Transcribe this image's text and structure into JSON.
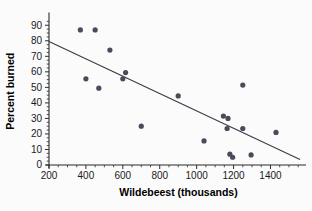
{
  "chart_data": {
    "type": "scatter",
    "title": "",
    "xlabel": "Wildebeest (thousands)",
    "ylabel": "Percent burned",
    "xlim": [
      200,
      1560
    ],
    "ylim": [
      0,
      95
    ],
    "xticks": [
      200,
      400,
      600,
      800,
      1000,
      1200,
      1400
    ],
    "xtick_labels": [
      "200",
      "400",
      "600",
      "800",
      "1000",
      "1200",
      "1400"
    ],
    "yticks": [
      0,
      10,
      20,
      30,
      40,
      50,
      60,
      70,
      80,
      90
    ],
    "ytick_labels": [
      "0",
      "10",
      "20",
      "30",
      "40",
      "50",
      "60",
      "70",
      "80",
      "90"
    ],
    "grid": false,
    "legend": null,
    "minor_ticks": true,
    "x": [
      370,
      450,
      400,
      470,
      530,
      600,
      615,
      700,
      900,
      1040,
      1145,
      1170,
      1165,
      1180,
      1195,
      1250,
      1250,
      1295,
      1430
    ],
    "y": [
      87,
      87,
      55.5,
      49.5,
      74,
      55.5,
      59.5,
      25,
      44.5,
      15.5,
      31.5,
      30,
      23.5,
      7,
      5,
      51.5,
      23.5,
      6.5,
      21
    ],
    "points": [
      {
        "x": 370,
        "y": 87
      },
      {
        "x": 450,
        "y": 87
      },
      {
        "x": 400,
        "y": 55.5
      },
      {
        "x": 470,
        "y": 49.5
      },
      {
        "x": 530,
        "y": 74
      },
      {
        "x": 600,
        "y": 55.5
      },
      {
        "x": 615,
        "y": 59.5
      },
      {
        "x": 700,
        "y": 25
      },
      {
        "x": 900,
        "y": 44.5
      },
      {
        "x": 1040,
        "y": 15.5
      },
      {
        "x": 1145,
        "y": 31.5
      },
      {
        "x": 1170,
        "y": 30
      },
      {
        "x": 1165,
        "y": 23.5
      },
      {
        "x": 1180,
        "y": 7
      },
      {
        "x": 1195,
        "y": 5
      },
      {
        "x": 1250,
        "y": 51.5
      },
      {
        "x": 1250,
        "y": 23.5
      },
      {
        "x": 1295,
        "y": 6.5
      },
      {
        "x": 1430,
        "y": 21
      }
    ],
    "trendline": {
      "type": "linear-fit",
      "x_start": 200,
      "y_start": 79.5,
      "x_end": 1560,
      "y_end": 3.5
    },
    "marker": {
      "shape": "circle",
      "color": "#4a4a58",
      "radius_px": 2.6
    },
    "colors": {
      "background": "#fbfbfb",
      "axis": "#2b2b2b",
      "point": "#4a4a58",
      "line": "#3a3a44",
      "text": "#1a1a1a"
    }
  }
}
